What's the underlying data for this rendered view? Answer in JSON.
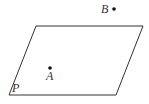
{
  "diagram": {
    "plane": {
      "label": "P",
      "points": "36,26 143,26 116,95 9,95",
      "stroke": "#333333"
    },
    "points": [
      {
        "label": "A",
        "x": 50,
        "y": 68,
        "label_x": 46,
        "label_y": 80
      },
      {
        "label": "B",
        "x": 114,
        "y": 9,
        "label_x": 101,
        "label_y": 13
      }
    ]
  }
}
